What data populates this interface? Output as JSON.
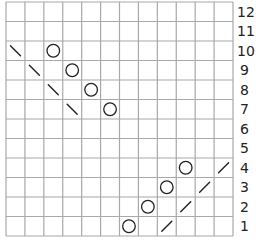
{
  "chart_data": {
    "type": "table",
    "title": "",
    "columns": 12,
    "rows": 12,
    "row_labels": [
      "1",
      "2",
      "3",
      "4",
      "5",
      "6",
      "7",
      "8",
      "9",
      "10",
      "11",
      "12"
    ],
    "grid_color": "#a8a8a8",
    "symbol_color": "#222222",
    "legend": {
      "O": "yarn over (circle)",
      "\\": "left-leaning decrease (backslash)",
      "/": "right-leaning decrease (slash)"
    },
    "cells": [
      {
        "row": 10,
        "col": 1,
        "symbol": "\\"
      },
      {
        "row": 10,
        "col": 3,
        "symbol": "O"
      },
      {
        "row": 9,
        "col": 2,
        "symbol": "\\"
      },
      {
        "row": 9,
        "col": 4,
        "symbol": "O"
      },
      {
        "row": 8,
        "col": 3,
        "symbol": "\\"
      },
      {
        "row": 8,
        "col": 5,
        "symbol": "O"
      },
      {
        "row": 7,
        "col": 4,
        "symbol": "\\"
      },
      {
        "row": 7,
        "col": 6,
        "symbol": "O"
      },
      {
        "row": 4,
        "col": 10,
        "symbol": "O"
      },
      {
        "row": 4,
        "col": 12,
        "symbol": "/"
      },
      {
        "row": 3,
        "col": 9,
        "symbol": "O"
      },
      {
        "row": 3,
        "col": 11,
        "symbol": "/"
      },
      {
        "row": 2,
        "col": 8,
        "symbol": "O"
      },
      {
        "row": 2,
        "col": 10,
        "symbol": "/"
      },
      {
        "row": 1,
        "col": 7,
        "symbol": "O"
      },
      {
        "row": 1,
        "col": 9,
        "symbol": "/"
      }
    ]
  }
}
